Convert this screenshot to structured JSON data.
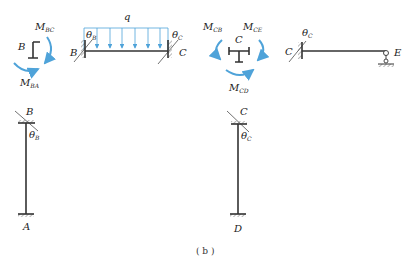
{
  "caption": "( b )",
  "colors": {
    "load": "#4fa3d9",
    "member": "#333333"
  },
  "joint_B_fbd": {
    "joint_label": "B",
    "moments": [
      {
        "symbol": "M",
        "subscript": "BC"
      },
      {
        "symbol": "M",
        "subscript": "BA"
      }
    ]
  },
  "beam_BC": {
    "left_label": "B",
    "right_label": "C",
    "load_label": "q",
    "rotation_left": {
      "symbol": "θ",
      "subscript": "B"
    },
    "rotation_right": {
      "symbol": "θ",
      "subscript": "C"
    },
    "load_arrows": 7
  },
  "joint_C_fbd": {
    "joint_label": "C",
    "moments": [
      {
        "symbol": "M",
        "subscript": "CB"
      },
      {
        "symbol": "M",
        "subscript": "CE"
      },
      {
        "symbol": "M",
        "subscript": "CD"
      }
    ]
  },
  "beam_CE": {
    "left_label": "C",
    "right_label": "E",
    "rotation_left": {
      "symbol": "θ",
      "subscript": "C"
    }
  },
  "column_AB": {
    "top_label": "B",
    "bottom_label": "A",
    "rotation_top": {
      "symbol": "θ",
      "subscript": "B"
    }
  },
  "column_DC": {
    "top_label": "C",
    "bottom_label": "D",
    "rotation_top": {
      "symbol": "θ",
      "subscript": "C"
    }
  }
}
